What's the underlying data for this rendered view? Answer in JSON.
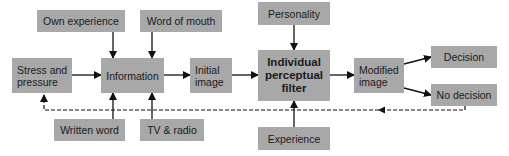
{
  "diagram": {
    "nodes": {
      "own_experience": "Own experience",
      "word_of_mouth": "Word of mouth",
      "personality": "Personality",
      "stress": "Stress and pressure",
      "stress_line1": "Stress and",
      "stress_line2": "pressure",
      "information": "Information",
      "initial_line1": "Initial",
      "initial_line2": "image",
      "filter_line1": "Individual",
      "filter_line2": "perceptual",
      "filter_line3": "filter",
      "modified_line1": "Modified",
      "modified_line2": "image",
      "decision": "Decision",
      "no_decision": "No decision",
      "written_word": "Written word",
      "tv_radio": "TV & radio",
      "experience": "Experience"
    },
    "edges": [
      {
        "from": "Own experience",
        "to": "Information",
        "style": "solid"
      },
      {
        "from": "Word of mouth",
        "to": "Information",
        "style": "solid"
      },
      {
        "from": "Written word",
        "to": "Information",
        "style": "solid"
      },
      {
        "from": "TV & radio",
        "to": "Information",
        "style": "solid"
      },
      {
        "from": "Stress and pressure",
        "to": "Information",
        "style": "solid"
      },
      {
        "from": "Information",
        "to": "Initial image",
        "style": "solid"
      },
      {
        "from": "Initial image",
        "to": "Individual perceptual filter",
        "style": "solid"
      },
      {
        "from": "Personality",
        "to": "Individual perceptual filter",
        "style": "solid"
      },
      {
        "from": "Experience",
        "to": "Individual perceptual filter",
        "style": "solid"
      },
      {
        "from": "Individual perceptual filter",
        "to": "Modified image",
        "style": "solid"
      },
      {
        "from": "Modified image",
        "to": "Decision",
        "style": "solid"
      },
      {
        "from": "Modified image",
        "to": "No decision",
        "style": "solid"
      },
      {
        "from": "No decision",
        "to": "Stress and pressure",
        "style": "dashed"
      }
    ],
    "colors": {
      "box": "#a8a8a8",
      "line": "#111111"
    }
  }
}
